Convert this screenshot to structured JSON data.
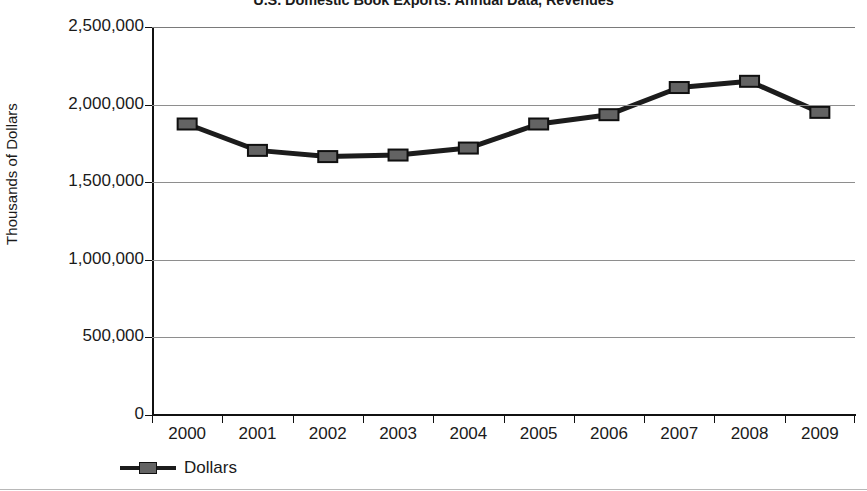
{
  "chart_data": {
    "type": "line",
    "title": "U.S. Domestic Book Exports: Annual Data, Revenues",
    "xlabel": "",
    "ylabel": "Thousands of Dollars",
    "categories": [
      "2000",
      "2001",
      "2002",
      "2003",
      "2004",
      "2005",
      "2006",
      "2007",
      "2008",
      "2009"
    ],
    "series": [
      {
        "name": "Dollars",
        "values": [
          1875000,
          1705000,
          1665000,
          1675000,
          1720000,
          1875000,
          1935000,
          2110000,
          2150000,
          1950000
        ]
      }
    ],
    "ylim": [
      0,
      2500000
    ],
    "y_ticks": [
      "0",
      "500,000",
      "1,000,000",
      "1,500,000",
      "2,000,000",
      "2,500,000"
    ],
    "y_tick_values": [
      0,
      500000,
      1000000,
      1500000,
      2000000,
      2500000
    ],
    "grid": true,
    "legend_position": "bottom-left",
    "marker": "square",
    "colors": {
      "line": "#1c1c1c",
      "marker_fill": "#636363",
      "marker_stroke": "#101010",
      "gridline": "#8e8e8e",
      "axis": "#111111",
      "text": "#1a1a1a"
    }
  },
  "legend": {
    "entries": [
      {
        "label": "Dollars"
      }
    ]
  }
}
